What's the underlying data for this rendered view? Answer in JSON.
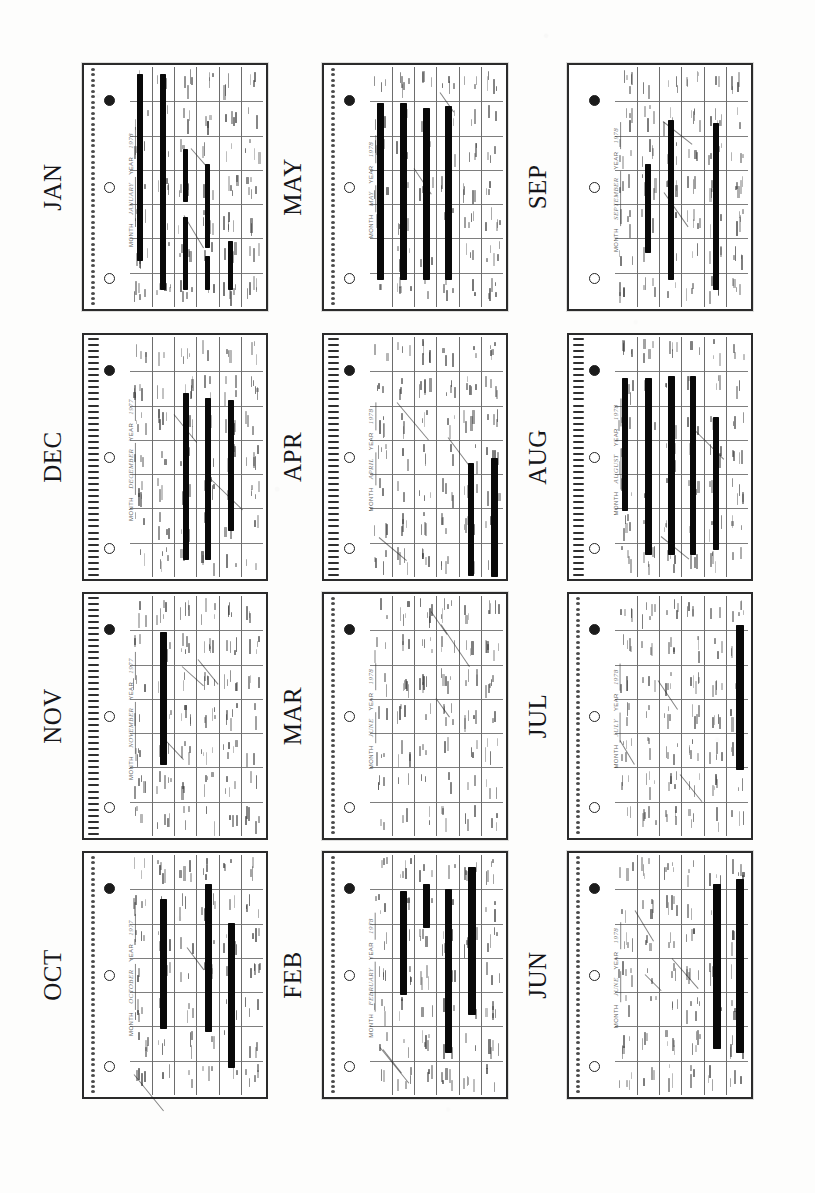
{
  "document": {
    "kind": "photocopied-calendar-sheet",
    "description": "Twelve spiral-bound desk-calendar month pages photocopied onto one sheet, each rotated 90 degrees, with handwritten entries blacked out by redaction bars.",
    "page_width": 815,
    "page_height": 1193,
    "background_color": "#fdfdfc",
    "ink_color": "#2b2b2b",
    "redaction_color": "#090909"
  },
  "layout": {
    "rows": 4,
    "columns": 3,
    "label_rotation_deg": -90,
    "panel_rotation_deg": -90
  },
  "header_template": {
    "month_field_label": "MONTH",
    "year_field_label": "YEAR",
    "weekday_headers": [
      "SUNDAY",
      "MONDAY",
      "TUESDAY",
      "WEDNESDAY",
      "THURSDAY",
      "FRIDAY",
      "SATURDAY"
    ]
  },
  "panels": [
    {
      "id": "jan",
      "label": "JAN",
      "month_written": "JANUARY",
      "year_written": "1978",
      "has_spiral": true,
      "spiral_style": "dotty",
      "outer_frame": true,
      "weeks": 6,
      "weekdays": 7,
      "redaction_count": 6,
      "redactions": [
        {
          "col": 0,
          "start": 0.03,
          "end": 0.8,
          "width": 6
        },
        {
          "col": 1,
          "start": 0.03,
          "end": 0.92,
          "width": 6
        },
        {
          "col": 2,
          "start": 0.34,
          "end": 0.56,
          "width": 5
        },
        {
          "col": 2,
          "start": 0.62,
          "end": 0.92,
          "width": 5
        },
        {
          "col": 3,
          "start": 0.4,
          "end": 0.75,
          "width": 5
        },
        {
          "col": 3,
          "start": 0.78,
          "end": 0.92,
          "width": 5
        },
        {
          "col": 4,
          "start": 0.72,
          "end": 0.92,
          "width": 5
        }
      ]
    },
    {
      "id": "may",
      "label": "MAY",
      "month_written": "MAY",
      "year_written": "1978",
      "has_spiral": true,
      "spiral_style": "dotty",
      "outer_frame": true,
      "weeks": 6,
      "weekdays": 7,
      "redaction_count": 4,
      "redactions": [
        {
          "col": 0,
          "start": 0.15,
          "end": 0.88,
          "width": 7
        },
        {
          "col": 1,
          "start": 0.15,
          "end": 0.88,
          "width": 7
        },
        {
          "col": 2,
          "start": 0.17,
          "end": 0.88,
          "width": 7
        },
        {
          "col": 3,
          "start": 0.16,
          "end": 0.88,
          "width": 7
        }
      ]
    },
    {
      "id": "sep",
      "label": "SEP",
      "month_written": "SEPTEMBER",
      "year_written": "1978",
      "has_spiral": false,
      "spiral_style": "none",
      "outer_frame": true,
      "weeks": 6,
      "weekdays": 7,
      "redaction_count": 3,
      "redactions": [
        {
          "col": 1,
          "start": 0.4,
          "end": 0.77,
          "width": 6
        },
        {
          "col": 2,
          "start": 0.22,
          "end": 0.88,
          "width": 6
        },
        {
          "col": 4,
          "start": 0.23,
          "end": 0.92,
          "width": 6
        }
      ]
    },
    {
      "id": "dec",
      "label": "DEC",
      "month_written": "DECEMBER",
      "year_written": "1977",
      "has_spiral": true,
      "spiral_style": "bars",
      "outer_frame": false,
      "weeks": 6,
      "weekdays": 7,
      "redaction_count": 3,
      "redactions": [
        {
          "col": 2,
          "start": 0.23,
          "end": 0.92,
          "width": 6
        },
        {
          "col": 3,
          "start": 0.25,
          "end": 0.92,
          "width": 6
        },
        {
          "col": 4,
          "start": 0.26,
          "end": 0.8,
          "width": 6
        }
      ]
    },
    {
      "id": "apr",
      "label": "APR",
      "month_written": "APRIL",
      "year_written": "1978",
      "has_spiral": true,
      "spiral_style": "bars",
      "outer_frame": false,
      "weeks": 6,
      "weekdays": 7,
      "redaction_count": 2,
      "redactions": [
        {
          "col": 4,
          "start": 0.52,
          "end": 0.99,
          "width": 6
        },
        {
          "col": 5,
          "start": 0.5,
          "end": 0.99,
          "width": 7
        }
      ]
    },
    {
      "id": "aug",
      "label": "AUG",
      "month_written": "AUGUST",
      "year_written": "1978",
      "has_spiral": true,
      "spiral_style": "bars",
      "outer_frame": false,
      "weeks": 6,
      "weekdays": 7,
      "redaction_count": 5,
      "redactions": [
        {
          "col": 0,
          "start": 0.17,
          "end": 0.72,
          "width": 6
        },
        {
          "col": 1,
          "start": 0.17,
          "end": 0.9,
          "width": 7
        },
        {
          "col": 2,
          "start": 0.16,
          "end": 0.9,
          "width": 7
        },
        {
          "col": 3,
          "start": 0.16,
          "end": 0.9,
          "width": 6
        },
        {
          "col": 4,
          "start": 0.33,
          "end": 0.88,
          "width": 6
        }
      ]
    },
    {
      "id": "nov",
      "label": "NOV",
      "month_written": "NOVEMBER",
      "year_written": "1977",
      "has_spiral": true,
      "spiral_style": "bars",
      "outer_frame": false,
      "weeks": 6,
      "weekdays": 7,
      "redaction_count": 1,
      "redactions": [
        {
          "col": 1,
          "start": 0.15,
          "end": 0.7,
          "width": 7
        }
      ]
    },
    {
      "id": "mar",
      "label": "MAR",
      "month_written": "JUNE",
      "year_written": "1978",
      "has_spiral": true,
      "spiral_style": "dotty",
      "outer_frame": true,
      "weeks": 6,
      "weekdays": 7,
      "redaction_count": 0,
      "redactions": []
    },
    {
      "id": "jul",
      "label": "JUL",
      "month_written": "JULY",
      "year_written": "1978",
      "has_spiral": true,
      "spiral_style": "dotty",
      "outer_frame": false,
      "weeks": 6,
      "weekdays": 7,
      "redaction_count": 1,
      "redactions": [
        {
          "col": 5,
          "start": 0.12,
          "end": 0.72,
          "width": 8
        }
      ]
    },
    {
      "id": "oct",
      "label": "OCT",
      "month_written": "OCTOBER",
      "year_written": "1977",
      "has_spiral": true,
      "spiral_style": "dotty",
      "outer_frame": false,
      "weeks": 6,
      "weekdays": 7,
      "redaction_count": 3,
      "redactions": [
        {
          "col": 1,
          "start": 0.18,
          "end": 0.72,
          "width": 7
        },
        {
          "col": 3,
          "start": 0.12,
          "end": 0.73,
          "width": 7
        },
        {
          "col": 4,
          "start": 0.28,
          "end": 0.88,
          "width": 7
        }
      ]
    },
    {
      "id": "feb",
      "label": "FEB",
      "month_written": "FEBRUARY",
      "year_written": "1978",
      "has_spiral": true,
      "spiral_style": "dotty",
      "outer_frame": true,
      "weeks": 6,
      "weekdays": 7,
      "redaction_count": 4,
      "redactions": [
        {
          "col": 1,
          "start": 0.15,
          "end": 0.58,
          "width": 7
        },
        {
          "col": 2,
          "start": 0.12,
          "end": 0.3,
          "width": 7
        },
        {
          "col": 3,
          "start": 0.14,
          "end": 0.82,
          "width": 7
        },
        {
          "col": 4,
          "start": 0.05,
          "end": 0.66,
          "width": 8
        }
      ]
    },
    {
      "id": "jun",
      "label": "JUN",
      "month_written": "JUNE",
      "year_written": "1978",
      "has_spiral": true,
      "spiral_style": "dotty",
      "outer_frame": true,
      "weeks": 6,
      "weekdays": 7,
      "redaction_count": 2,
      "redactions": [
        {
          "col": 4,
          "start": 0.12,
          "end": 0.8,
          "width": 8
        },
        {
          "col": 5,
          "start": 0.1,
          "end": 0.82,
          "width": 8
        }
      ]
    }
  ],
  "geometry": {
    "label_x": [
      30,
      270,
      515
    ],
    "panel_x": [
      82,
      322,
      567
    ],
    "row_y": [
      63,
      333,
      592,
      851
    ],
    "panel_w": 186,
    "panel_h": 248,
    "label_block_w": 46,
    "label_block_h": 60
  }
}
